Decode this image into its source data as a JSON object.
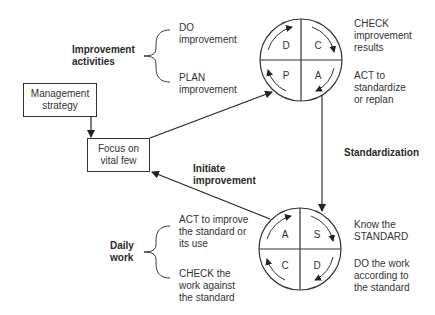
{
  "improvement": {
    "group_label_line1": "Improvement",
    "group_label_line2": "activities",
    "do_line1": "DO",
    "do_line2": "improvement",
    "plan_line1": "PLAN",
    "plan_line2": "improvement"
  },
  "pdca_cycle": {
    "quadrants": {
      "top_left": "D",
      "top_right": "C",
      "bottom_left": "P",
      "bottom_right": "A"
    },
    "check_line1": "CHECK",
    "check_line2": "improvement",
    "check_line3": "results",
    "act_line1": "ACT to",
    "act_line2": "standardize",
    "act_line3": "or replan"
  },
  "management_box": {
    "line1": "Management",
    "line2": "strategy"
  },
  "focus_box": {
    "line1": "Focus on",
    "line2": "vital few"
  },
  "initiate": {
    "line1": "Initiate",
    "line2": "improvement"
  },
  "standardization_label": "Standardization",
  "sdca_cycle": {
    "quadrants": {
      "top_left": "A",
      "top_right": "S",
      "bottom_left": "C",
      "bottom_right": "D"
    },
    "know_line1": "Know the",
    "know_line2": "STANDARD",
    "do_line1": "DO the work",
    "do_line2": "according to",
    "do_line3": "the standard"
  },
  "daily_work": {
    "group_label_line1": "Daily",
    "group_label_line2": "work",
    "act_line1": "ACT to improve",
    "act_line2": "the standard or",
    "act_line3": "its use",
    "check_line1": "CHECK the",
    "check_line2": "work against",
    "check_line3": "the standard"
  },
  "colors": {
    "line": "#333333",
    "text": "#333333"
  }
}
